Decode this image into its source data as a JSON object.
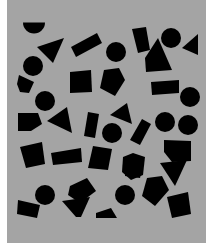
{
  "image": {
    "width": 219,
    "height": 243,
    "background": "#ffffff",
    "panel": {
      "x": 7,
      "y": 0,
      "w": 199,
      "h": 243,
      "color": "#a4a4a4"
    },
    "shape_color": "#000000"
  },
  "shapes": [
    {
      "type": "semicircle",
      "cx": 34,
      "cy": 28,
      "r": 11,
      "rot": 0
    },
    {
      "type": "polygon",
      "points": "37,47 64,38 53,63"
    },
    {
      "type": "polygon",
      "points": "71,47 97,33 102,43 76,57"
    },
    {
      "type": "circle",
      "cx": 33,
      "cy": 66,
      "r": 10
    },
    {
      "type": "circle",
      "cx": 116,
      "cy": 52,
      "r": 10
    },
    {
      "type": "polygon",
      "points": "132,29 146,27 150,50 138,53"
    },
    {
      "type": "circle",
      "cx": 171,
      "cy": 38,
      "r": 10
    },
    {
      "type": "polygon",
      "points": "182,48 198,34 198,55"
    },
    {
      "type": "polygon",
      "points": "145,58 158,38 172,70 146,72"
    },
    {
      "type": "polygon",
      "points": "19,75 34,82 29,93 20,92 17,84"
    },
    {
      "type": "polygon",
      "points": "70,72 91,70 92,92 70,93"
    },
    {
      "type": "polygon",
      "points": "104,70 119,68 125,80 115,96 100,88"
    },
    {
      "type": "polygon",
      "points": "151,82 179,80 179,93 152,95"
    },
    {
      "type": "circle",
      "cx": 190,
      "cy": 97,
      "r": 10
    },
    {
      "type": "circle",
      "cx": 45,
      "cy": 101,
      "r": 10
    },
    {
      "type": "polygon",
      "points": "18,113 38,113 42,124 31,131 18,131"
    },
    {
      "type": "polygon",
      "points": "47,121 67,107 72,133"
    },
    {
      "type": "polygon",
      "points": "88,112 99,114 95,138 84,136"
    },
    {
      "type": "polygon",
      "points": "110,115 127,103 132,124"
    },
    {
      "type": "circle",
      "cx": 112,
      "cy": 133,
      "r": 10
    },
    {
      "type": "polygon",
      "points": "142,119 151,124 140,145 130,140"
    },
    {
      "type": "circle",
      "cx": 165,
      "cy": 122,
      "r": 10
    },
    {
      "type": "circle",
      "cx": 188,
      "cy": 125,
      "r": 10
    },
    {
      "type": "polygon",
      "points": "20,147 42,142 45,164 26,168"
    },
    {
      "type": "polygon",
      "points": "51,153 81,148 82,162 53,165"
    },
    {
      "type": "polygon",
      "points": "93,146 112,149 108,170 88,168"
    },
    {
      "type": "polygon",
      "points": "123,157 133,153 145,157 143,175 131,180 122,172"
    },
    {
      "type": "polygon",
      "points": "164,140 191,141 191,161 172,162 164,152"
    },
    {
      "type": "polygon",
      "points": "160,163 187,160 175,186"
    },
    {
      "type": "polygon",
      "points": "70,186 87,178 96,191 80,203 68,195"
    },
    {
      "type": "circle",
      "cx": 45,
      "cy": 195,
      "r": 10
    },
    {
      "type": "polygon",
      "points": "18,200 40,205 37,218 17,214"
    },
    {
      "type": "polygon",
      "points": "62,201 90,197 81,217 76,217"
    },
    {
      "type": "polygon",
      "points": "96,213 111,208 117,218 96,218"
    },
    {
      "type": "circle",
      "cx": 125,
      "cy": 195,
      "r": 10
    },
    {
      "type": "polygon",
      "points": "147,178 162,176 169,190 155,206 142,196"
    },
    {
      "type": "polygon",
      "points": "167,197 188,192 191,214 172,218"
    },
    {
      "type": "polygon",
      "points": "126,165 142,169 140,178 125,176"
    }
  ]
}
